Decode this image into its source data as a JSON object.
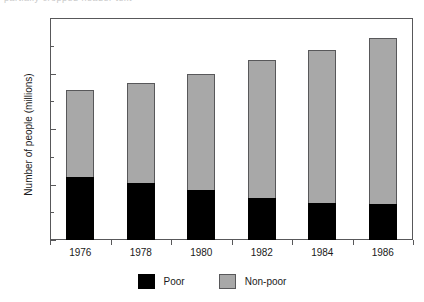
{
  "page_header_sliver": "partially cropped header text",
  "chart_data": {
    "type": "bar",
    "subtype": "stacked",
    "title": "",
    "xlabel": "",
    "ylabel": "Number of people (millions)",
    "categories": [
      "1976",
      "1978",
      "1980",
      "1982",
      "1984",
      "1986"
    ],
    "series": [
      {
        "name": "Poor",
        "color": "#000000",
        "values": [
          57,
          51,
          45,
          38,
          33,
          32
        ]
      },
      {
        "name": "Non-poor",
        "color": "#a8a8a8",
        "values": [
          78,
          90,
          105,
          124,
          138,
          150
        ]
      }
    ],
    "totals": [
      135,
      141,
      150,
      162,
      171,
      182
    ],
    "ylim": [
      0,
      200
    ],
    "ytick_major": [
      0,
      50,
      100,
      150,
      200
    ],
    "ytick_minor": [
      25,
      75,
      125,
      175
    ],
    "ytick_labels": [
      "0",
      "50",
      "100",
      "150",
      "200"
    ],
    "grid": false,
    "legend_position": "bottom-center",
    "legend_entries": [
      "Poor",
      "Non-poor"
    ],
    "frame_color": "#58585a"
  }
}
